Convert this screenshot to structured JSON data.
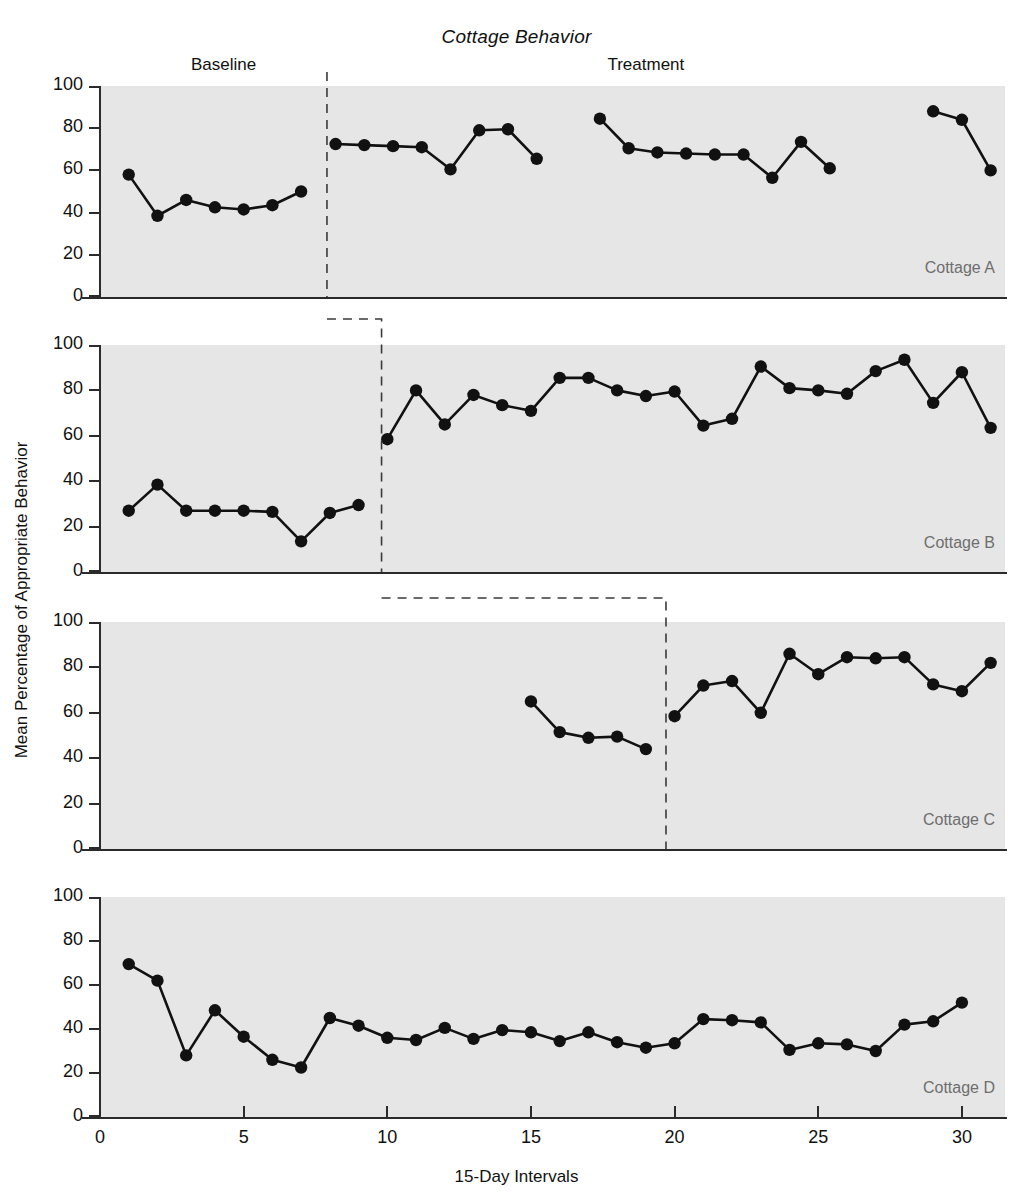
{
  "chart_data": {
    "type": "line",
    "title": "Cottage Behavior",
    "xlabel": "15-Day Intervals",
    "ylabel": "Mean Percentage of Appropriate Behavior",
    "xlim": [
      0,
      31.5
    ],
    "ylim": [
      0,
      100
    ],
    "xticks": [
      0,
      5,
      10,
      15,
      20,
      25,
      30
    ],
    "yticks": [
      0,
      20,
      40,
      60,
      80,
      100
    ],
    "grid": false,
    "legend": "none",
    "design": "multiple-baseline across cottages",
    "phase_labels": [
      {
        "text": "Baseline",
        "x": 4.3
      },
      {
        "text": "Treatment",
        "x": 19.0
      }
    ],
    "panels": [
      {
        "name": "Cottage A",
        "phase_change_x": 7.9,
        "segments": [
          {
            "phase": "baseline",
            "x": [
              1,
              2,
              3,
              4,
              5,
              6,
              7
            ],
            "y": [
              58,
              38.5,
              46,
              42.5,
              41.5,
              43.5,
              50
            ]
          },
          {
            "phase": "treatment",
            "x": [
              8.2,
              9.2,
              10.2,
              11.2,
              12.2,
              13.2,
              14.2,
              15.2
            ],
            "y": [
              72.5,
              72,
              71.5,
              71,
              60.5,
              79,
              79.5,
              65.5
            ]
          },
          {
            "phase": "treatment",
            "x": [
              17.4,
              18.4,
              19.4,
              20.4,
              21.4,
              22.4,
              23.4,
              24.4,
              25.4
            ],
            "y": [
              84.5,
              70.5,
              68.5,
              68,
              67.5,
              67.5,
              56.5,
              73.5,
              61
            ]
          },
          {
            "phase": "treatment",
            "x": [
              29,
              30,
              31
            ],
            "y": [
              88,
              84,
              60
            ]
          }
        ]
      },
      {
        "name": "Cottage B",
        "phase_change_x": 9.8,
        "segments": [
          {
            "phase": "baseline",
            "x": [
              1,
              2,
              3,
              4,
              5,
              6,
              7,
              8,
              9
            ],
            "y": [
              27,
              38.5,
              27,
              27,
              27,
              26.5,
              13.5,
              26,
              29.5
            ]
          },
          {
            "phase": "treatment",
            "x": [
              10,
              11,
              12,
              13,
              14,
              15,
              16,
              17,
              18,
              19,
              20,
              21,
              22,
              23,
              24,
              25,
              26,
              27,
              28,
              29,
              30,
              31
            ],
            "y": [
              58.5,
              80,
              65,
              78,
              73.5,
              71,
              85.5,
              85.5,
              80,
              77.5,
              79.5,
              64.5,
              67.5,
              90.5,
              81,
              80,
              78.5,
              88.5,
              93.5,
              74.5,
              88,
              63.5
            ]
          }
        ]
      },
      {
        "name": "Cottage C",
        "phase_change_x": 19.7,
        "segments": [
          {
            "phase": "baseline",
            "x": [
              15,
              16,
              17,
              18,
              19
            ],
            "y": [
              65,
              51.5,
              49,
              49.5,
              44
            ]
          },
          {
            "phase": "treatment",
            "x": [
              20,
              21,
              22,
              23,
              24,
              25,
              26,
              27,
              28,
              29,
              30,
              31
            ],
            "y": [
              58.5,
              72,
              74,
              60,
              86,
              77,
              84.5,
              84,
              84.5,
              72.5,
              69.5,
              82
            ]
          }
        ]
      },
      {
        "name": "Cottage D",
        "phase_change_x": null,
        "segments": [
          {
            "phase": "baseline",
            "x": [
              1,
              2,
              3,
              4,
              5,
              6,
              7,
              8,
              9,
              10,
              11,
              12,
              13,
              14,
              15,
              16,
              17,
              18,
              19,
              20,
              21,
              22,
              23,
              24,
              25,
              26,
              27,
              28,
              29,
              30
            ],
            "y": [
              69.5,
              62,
              28,
              48.5,
              36.5,
              26,
              22.5,
              45,
              41.5,
              36,
              35,
              40.5,
              35.5,
              39.5,
              38.5,
              34.5,
              38.5,
              34,
              31.5,
              33.5,
              44.5,
              44,
              43,
              30.5,
              33.5,
              33,
              30,
              42,
              43.5,
              52
            ]
          }
        ]
      }
    ]
  },
  "panel_labels": {
    "a": "Cottage A",
    "b": "Cottage B",
    "c": "Cottage C",
    "d": "Cottage D"
  }
}
